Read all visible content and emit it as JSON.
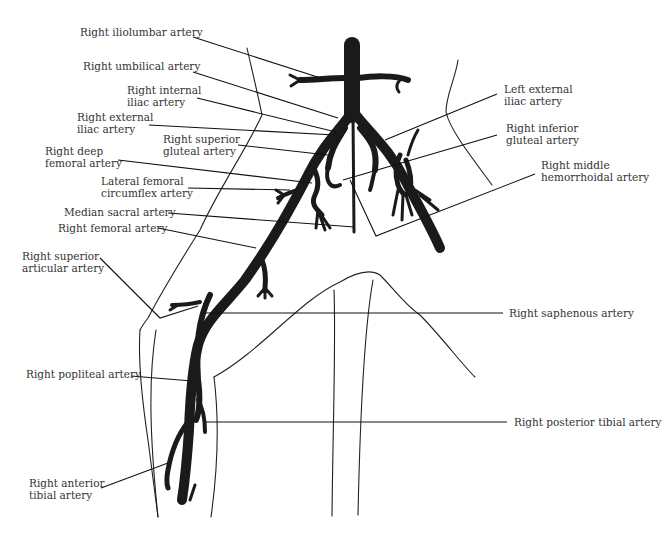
{
  "figure": {
    "colors": {
      "artery": "#1a1a1a",
      "outline": "#222222",
      "text": "#333333",
      "background": "#ffffff"
    }
  },
  "labels": {
    "right_iliolumbar": [
      "Right iliolumbar artery"
    ],
    "right_umbilical": [
      "Right umbilical artery"
    ],
    "right_internal_iliac": [
      "Right internal",
      "iliac artery"
    ],
    "right_external_iliac": [
      "Right external",
      "iliac artery"
    ],
    "right_superior_gluteal": [
      "Right superior",
      "gluteal artery"
    ],
    "right_deep_femoral": [
      "Right deep",
      "femoral artery"
    ],
    "lateral_femoral_circumflex": [
      "Lateral femoral",
      "circumflex artery"
    ],
    "median_sacral": [
      "Median sacral artery"
    ],
    "right_femoral": [
      "Right femoral artery"
    ],
    "right_superior_articular": [
      "Right superior",
      "articular artery"
    ],
    "right_popliteal": [
      "Right popliteal artery"
    ],
    "right_anterior_tibial": [
      "Right anterior",
      "tibial artery"
    ],
    "left_external_iliac": [
      "Left external",
      "iliac artery"
    ],
    "right_inferior_gluteal": [
      "Right inferior",
      "gluteal artery"
    ],
    "right_middle_hemorrhoidal": [
      "Right middle",
      "hemorrhoidal artery"
    ],
    "right_saphenous": [
      "Right saphenous artery"
    ],
    "right_posterior_tibial": [
      "Right posterior tibial artery"
    ]
  }
}
